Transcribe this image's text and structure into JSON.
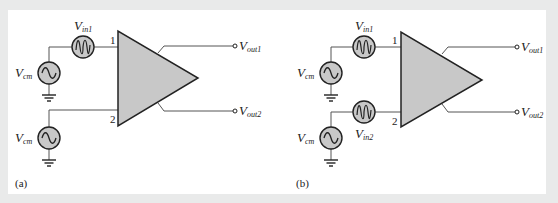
{
  "diagram": {
    "type": "differential amplifier input configurations",
    "colors": {
      "background": "#e9eaea",
      "panel": "#ffffff",
      "amp_fill": "#c8c8c8",
      "source_fill": "#c8c8c8",
      "wire": "#555555",
      "stroke": "#222222"
    },
    "panels": [
      {
        "caption": "(a)",
        "sources": [
          {
            "label_main": "V",
            "label_sub": "in1",
            "kind": "signal"
          },
          {
            "label_main": "V",
            "label_sub": "cm",
            "kind": "common-mode"
          },
          {
            "label_main": "V",
            "label_sub": "cm",
            "kind": "common-mode"
          }
        ],
        "amplifier": {
          "pin1": "1",
          "pin2": "2"
        },
        "outputs": [
          {
            "label_main": "V",
            "label_sub": "out1"
          },
          {
            "label_main": "V",
            "label_sub": "out2"
          }
        ]
      },
      {
        "caption": "(b)",
        "sources": [
          {
            "label_main": "V",
            "label_sub": "in1",
            "kind": "signal"
          },
          {
            "label_main": "V",
            "label_sub": "cm",
            "kind": "common-mode"
          },
          {
            "label_main": "V",
            "label_sub": "in2",
            "kind": "signal"
          },
          {
            "label_main": "V",
            "label_sub": "cm",
            "kind": "common-mode"
          }
        ],
        "amplifier": {
          "pin1": "1",
          "pin2": "2"
        },
        "outputs": [
          {
            "label_main": "V",
            "label_sub": "out1"
          },
          {
            "label_main": "V",
            "label_sub": "out2"
          }
        ]
      }
    ]
  }
}
